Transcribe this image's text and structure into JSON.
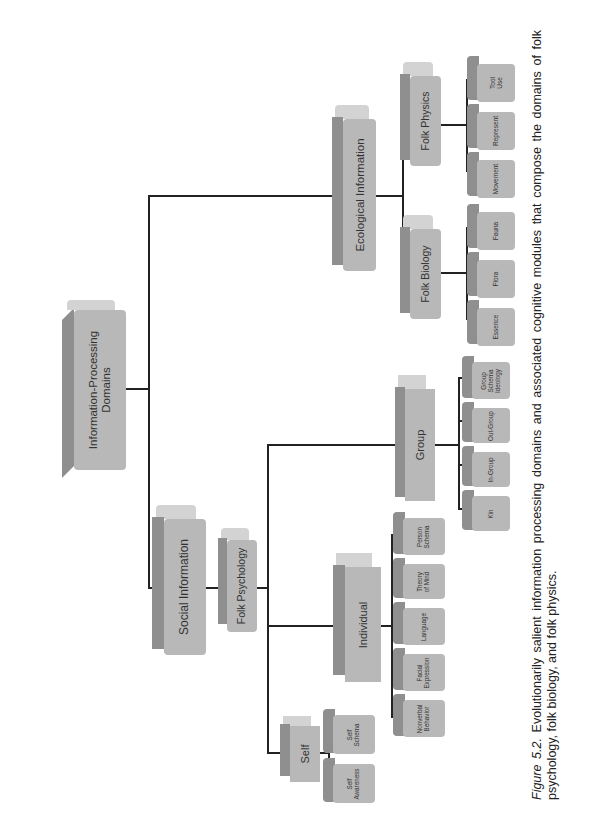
{
  "diagram": {
    "root": {
      "label": "Information-Processing Domains"
    },
    "social": {
      "label": "Social Information",
      "folk_psychology": {
        "label": "Folk Psychology",
        "self": {
          "label": "Self",
          "children": [
            "Self Awareness",
            "Self Schema"
          ]
        },
        "individual": {
          "label": "Individual",
          "children": [
            "Nonverbal Behavior",
            "Facial Expression",
            "Language",
            "Theory of Mind",
            "Person Schema"
          ]
        },
        "group": {
          "label": "Group",
          "children": [
            "Kin",
            "In-Group",
            "Out-Group",
            "Group Schema Ideology"
          ]
        }
      }
    },
    "ecological": {
      "label": "Ecological Information",
      "folk_biology": {
        "label": "Folk Biology",
        "children": [
          "Essence",
          "Flora",
          "Fauna"
        ]
      },
      "folk_physics": {
        "label": "Folk Physics",
        "children": [
          "Movement",
          "Represent",
          "Tool Use"
        ]
      }
    }
  },
  "caption": {
    "figure_label": "Figure 5.2.",
    "text": "Evolutionarily salient information processing domains and associated cognitive modules that compose the domains of folk psychology, folk biology, and folk physics."
  },
  "colors": {
    "box_face": "#b8b8b8",
    "box_side": "#8f8f8f",
    "box_top": "#d3d3d3",
    "connector": "#222222"
  }
}
